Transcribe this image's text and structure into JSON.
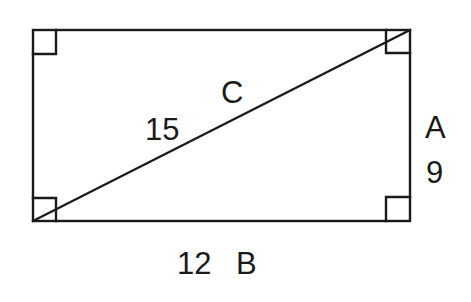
{
  "diagram": {
    "type": "rectangle-with-diagonal",
    "stroke_color": "#1a1a1a",
    "background": "#ffffff",
    "rectangle": {
      "x": 33,
      "y": 30,
      "width": 377,
      "height": 191
    },
    "diagonal": {
      "from": [
        33,
        221
      ],
      "to": [
        410,
        30
      ]
    },
    "right_angle_markers": 4,
    "labels": {
      "diagonal_letter": "C",
      "diagonal_value": "15",
      "vertical_letter": "A",
      "vertical_value": "9",
      "horizontal_value": "12",
      "horizontal_letter": "B"
    }
  }
}
